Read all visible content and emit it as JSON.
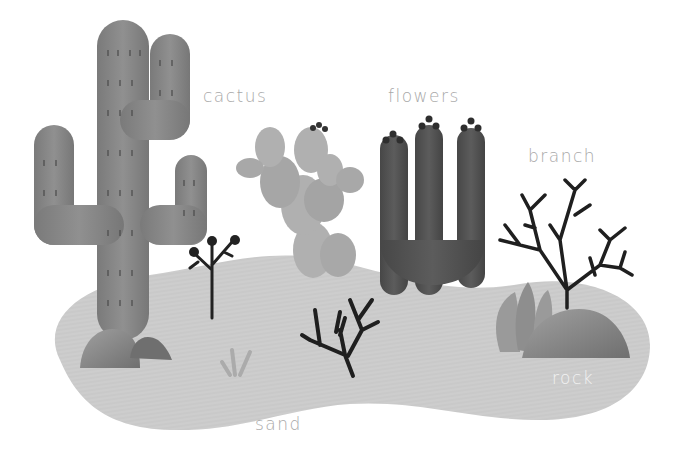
{
  "labels": {
    "cactus": "cactus",
    "flowers": "flowers",
    "branch": "branch",
    "rock": "rock",
    "sand": "sand"
  },
  "colors": {
    "background": "#ffffff",
    "sand": "#c9c9c9",
    "sand_shadow": "#b8b8b8",
    "saguaro": "#858585",
    "prickly_pear": "#b0b0b0",
    "flower_cactus": "#505050",
    "branch": "#1f1f1f",
    "rock": "#8a8a8a",
    "label_text": "#a8a8a8",
    "label_text_light": "#f2f2f2"
  }
}
